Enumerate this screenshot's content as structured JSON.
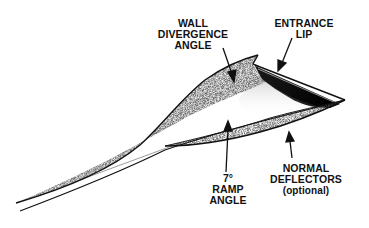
{
  "diagram": {
    "colors": {
      "background": "#ffffff",
      "ink": "#111111",
      "stipple": "#6b6b6b"
    },
    "labels": {
      "wall_divergence": {
        "line1": "WALL",
        "line2": "DIVERGENCE",
        "line3": "ANGLE"
      },
      "entrance_lip": {
        "line1": "ENTRANCE",
        "line2": "LIP"
      },
      "ramp_angle": {
        "line1": "7°",
        "line2": "RAMP",
        "line3": "ANGLE"
      },
      "normal_deflectors": {
        "line1": "NORMAL",
        "line2": "DEFLECTORS",
        "line3": "(optional)"
      }
    }
  }
}
